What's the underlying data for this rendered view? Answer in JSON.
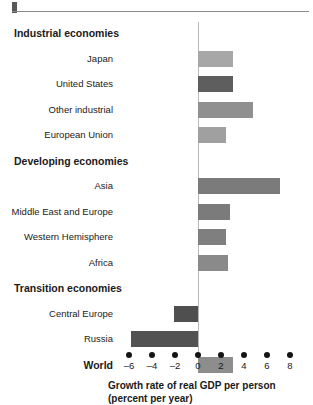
{
  "chart_data": {
    "type": "bar",
    "orientation": "horizontal",
    "title": "",
    "xlabel": "Growth rate of real GDP per person (percent per year)",
    "ylabel": "",
    "xlim": [
      -6,
      8
    ],
    "xticks": [
      -6,
      -4,
      -2,
      0,
      2,
      4,
      6,
      8
    ],
    "xtick_labels": [
      "–6",
      "–4",
      "–2",
      "0",
      "2",
      "4",
      "6",
      "8"
    ],
    "grid": false,
    "legend": "none",
    "zero_line": true,
    "categories": [
      "Japan",
      "United States",
      "Other industrial",
      "European Union",
      "Asia",
      "Middle East and Europe",
      "Western Hemisphere",
      "Africa",
      "Central Europe",
      "Russia",
      "World"
    ],
    "values": [
      3.0,
      3.0,
      4.8,
      2.4,
      7.1,
      2.8,
      2.4,
      2.6,
      -2.1,
      -5.8,
      3.0
    ],
    "group_headings": [
      "Industrial economies",
      "Developing economies",
      "Transition economies"
    ],
    "rows": [
      {
        "kind": "group",
        "label": "Industrial economies",
        "value": null,
        "color": ""
      },
      {
        "kind": "bar",
        "label": "Japan",
        "value": 3.0,
        "color": "#a7a7a7"
      },
      {
        "kind": "bar",
        "label": "United States",
        "value": 3.0,
        "color": "#5e5e5e"
      },
      {
        "kind": "bar",
        "label": "Other industrial",
        "value": 4.8,
        "color": "#909090"
      },
      {
        "kind": "bar",
        "label": "European Union",
        "value": 2.4,
        "color": "#a0a0a0"
      },
      {
        "kind": "group",
        "label": "Developing economies",
        "value": null,
        "color": ""
      },
      {
        "kind": "bar",
        "label": "Asia",
        "value": 7.1,
        "color": "#7b7b7b"
      },
      {
        "kind": "bar",
        "label": "Middle East and Europe",
        "value": 2.8,
        "color": "#7b7b7b"
      },
      {
        "kind": "bar",
        "label": "Western Hemisphere",
        "value": 2.4,
        "color": "#7f7f7f"
      },
      {
        "kind": "bar",
        "label": "Africa",
        "value": 2.6,
        "color": "#8a8a8a"
      },
      {
        "kind": "group",
        "label": "Transition economies",
        "value": null,
        "color": ""
      },
      {
        "kind": "bar",
        "label": "Central Europe",
        "value": -2.1,
        "color": "#4f4f4f"
      },
      {
        "kind": "bar",
        "label": "Russia",
        "value": -5.8,
        "color": "#525252"
      },
      {
        "kind": "world",
        "label": "World",
        "value": 3.0,
        "color": "#8d8d8d"
      }
    ],
    "axis_title_lines": [
      "Growth rate of real GDP per person",
      "(percent per year)"
    ]
  }
}
